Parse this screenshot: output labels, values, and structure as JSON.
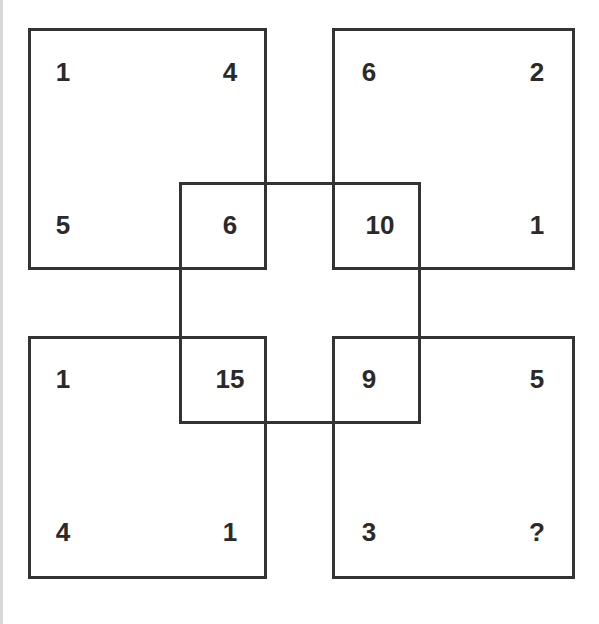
{
  "puzzle": {
    "squares": {
      "top_left": {
        "tl": "1",
        "tr": "4",
        "bl": "5",
        "br": "6"
      },
      "top_right": {
        "tl": "6",
        "tr": "2",
        "bl": "10",
        "br": "1"
      },
      "bottom_left": {
        "tl": "1",
        "tr": "15",
        "bl": "4",
        "br": "1"
      },
      "bottom_right": {
        "tl": "9",
        "tr": "5",
        "bl": "3",
        "br": "?"
      }
    },
    "line_color": "#333333"
  }
}
